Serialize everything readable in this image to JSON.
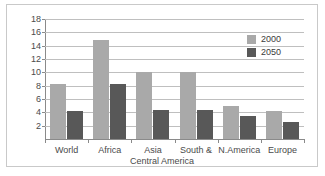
{
  "chart_data": {
    "type": "bar",
    "title": "",
    "xlabel": "Central America",
    "ylabel": "",
    "categories": [
      "World",
      "Africa",
      "Asia",
      "South &",
      "N.America",
      "Europe"
    ],
    "series": [
      {
        "name": "2000",
        "color": "#a9a9a9",
        "values": [
          8.3,
          14.9,
          10.0,
          10.0,
          5.0,
          4.2
        ]
      },
      {
        "name": "2050",
        "color": "#585858",
        "values": [
          4.2,
          8.3,
          4.3,
          4.3,
          3.4,
          2.6
        ]
      }
    ],
    "ylim": [
      0,
      18
    ],
    "yticks": [
      2,
      4,
      6,
      8,
      10,
      12,
      14,
      16,
      18
    ],
    "ytick_labels": [
      "2",
      "4",
      "6",
      "8",
      "10",
      "12",
      "14",
      "16",
      "18"
    ],
    "grid": true,
    "legend_position": "top-right"
  },
  "legend": {
    "entries": [
      {
        "label": "2000",
        "color": "#a9a9a9"
      },
      {
        "label": "2050",
        "color": "#585858"
      }
    ]
  },
  "axis": {
    "x_caption_line2": "Central America"
  }
}
